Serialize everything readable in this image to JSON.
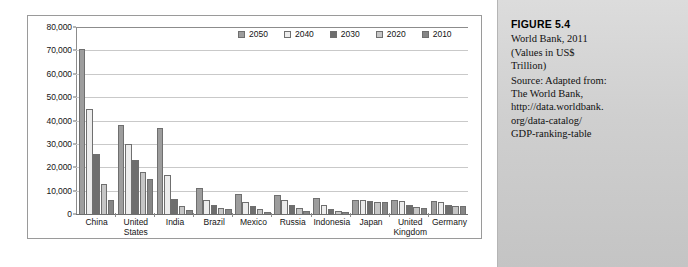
{
  "figure": {
    "number_label": "FIGURE 5.4",
    "title_lines": [
      "World Bank, 2011",
      "(Values in US$",
      "Trillion)"
    ],
    "source_lines": [
      "Source: Adapted from:",
      "The World Bank,",
      "http://data.worldbank.",
      "org/data-catalog/",
      "GDP-ranking-table"
    ]
  },
  "chart_data": {
    "type": "bar",
    "title": "",
    "xlabel": "",
    "ylabel": "",
    "ylim": [
      0,
      80000
    ],
    "ytick_labels": [
      "80,000",
      "70,000",
      "60,000",
      "50,000",
      "40,000",
      "30,000",
      "20,000",
      "10,000",
      "0"
    ],
    "ytick_values": [
      80000,
      70000,
      60000,
      50000,
      40000,
      30000,
      20000,
      10000,
      0
    ],
    "grid": true,
    "legend_position": "top-right",
    "categories": [
      "China",
      "United States",
      "India",
      "Brazil",
      "Mexico",
      "Russia",
      "Indonesia",
      "Japan",
      "United Kingdom",
      "Germany"
    ],
    "category_label_lines": [
      [
        "China"
      ],
      [
        "United",
        "States"
      ],
      [
        "India"
      ],
      [
        "Brazil"
      ],
      [
        "Mexico"
      ],
      [
        "Russia"
      ],
      [
        "Indonesia"
      ],
      [
        "Japan"
      ],
      [
        "United",
        "Kingdom"
      ],
      [
        "Germany"
      ]
    ],
    "series": [
      {
        "name": "2050",
        "color": "#9d9d9d",
        "values": [
          70500,
          38000,
          37000,
          11000,
          8500,
          8000,
          7000,
          6200,
          6000,
          5500
        ]
      },
      {
        "name": "2040",
        "color": "#ececec",
        "values": [
          45000,
          30000,
          16500,
          6200,
          5200,
          6000,
          4000,
          6000,
          5500,
          5000
        ]
      },
      {
        "name": "2030",
        "color": "#6e6e6e",
        "values": [
          25500,
          23000,
          6500,
          4000,
          3500,
          4000,
          2000,
          5600,
          4000,
          4000
        ]
      },
      {
        "name": "2020",
        "color": "#c6c6c6",
        "values": [
          13000,
          18000,
          3500,
          2500,
          2000,
          2500,
          1200,
          5100,
          3000,
          3400
        ]
      },
      {
        "name": "2010",
        "color": "#868686",
        "values": [
          5900,
          15000,
          1700,
          2000,
          1000,
          1500,
          700,
          5000,
          2400,
          3300
        ]
      }
    ]
  }
}
